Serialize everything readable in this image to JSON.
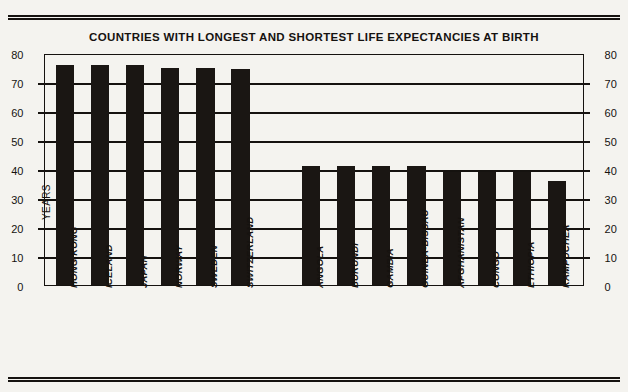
{
  "page": {
    "background_color": "#f4f3ef",
    "ink_color": "#15120f"
  },
  "rules": {
    "top_name": "top-double-rule",
    "bottom_name": "bottom-double-rule"
  },
  "chart_data": {
    "type": "bar",
    "title": "COUNTRIES WITH LONGEST AND SHORTEST LIFE EXPECTANCIES AT BIRTH",
    "xlabel": "",
    "ylabel": "YEARS",
    "ylim": [
      0,
      80
    ],
    "yticks": [
      0,
      10,
      20,
      30,
      40,
      50,
      60,
      70,
      80
    ],
    "ytick_labels": [
      "0",
      "10",
      "20",
      "30",
      "40",
      "50",
      "60",
      "70",
      "80"
    ],
    "grid": true,
    "legend": false,
    "dual_axis": true,
    "bar_color": "#1a1613",
    "categories": [
      "HONG KONG",
      "ICELAND",
      "JAPAN",
      "NORWAY",
      "SWEDEN",
      "SWITZERLAND",
      "ANGOLA",
      "BURUNDI",
      "GAMBIA",
      "GUINEA-BISSAU",
      "AFGHANISTAN",
      "CONGO",
      "ETHIOPIA",
      "KAMPUCHEA"
    ],
    "values": [
      76,
      76,
      76,
      75,
      75,
      74.5,
      41,
      41,
      41,
      41,
      39,
      39,
      39,
      36
    ],
    "group_gap_after_index": 5
  }
}
